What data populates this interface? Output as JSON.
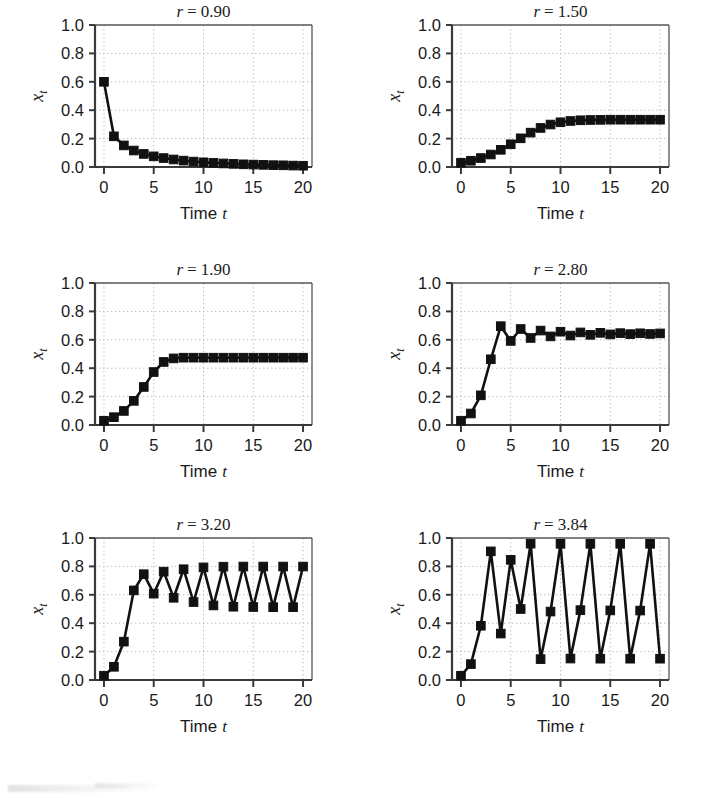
{
  "figure": {
    "panel_count": 6,
    "axis": {
      "xlabel_prefix": "Time",
      "xlabel_italic": "t",
      "ylabel": "x",
      "ylabel_sub": "t",
      "x_ticks": [
        "0",
        "5",
        "10",
        "15",
        "20"
      ],
      "x_tick_values": [
        0,
        5,
        10,
        15,
        20
      ],
      "y_ticks": [
        "0.0",
        "0.2",
        "0.4",
        "0.6",
        "0.8",
        "1.0"
      ],
      "y_tick_values": [
        0.0,
        0.2,
        0.4,
        0.6,
        0.8,
        1.0
      ],
      "xlim": [
        -0.9,
        20.9
      ],
      "ylim": [
        0.0,
        1.0
      ]
    },
    "style": {
      "line_color": "#111111",
      "marker_color": "#111111",
      "marker_shape": "square",
      "grid_color": "#bdbdbd",
      "grid_style": "dotted",
      "frame_color": "#555555",
      "background": "#ffffff"
    }
  },
  "chart_data": [
    {
      "type": "line",
      "title": "r = 0.90",
      "title_symbol": "r",
      "title_value": "0.90",
      "r": 0.9,
      "xlabel": "Time t",
      "ylabel": "x_t",
      "xlim": [
        -0.9,
        20.9
      ],
      "ylim": [
        0.0,
        1.0
      ],
      "grid": true,
      "legend": "none",
      "x": [
        0,
        1,
        2,
        3,
        4,
        5,
        6,
        7,
        8,
        9,
        10,
        11,
        12,
        13,
        14,
        15,
        16,
        17,
        18,
        19,
        20
      ],
      "values": [
        0.6,
        0.216,
        0.152,
        0.116,
        0.092,
        0.075,
        0.063,
        0.053,
        0.045,
        0.038,
        0.033,
        0.029,
        0.025,
        0.022,
        0.019,
        0.017,
        0.015,
        0.013,
        0.012,
        0.01,
        0.009
      ]
    },
    {
      "type": "line",
      "title": "r = 1.50",
      "title_symbol": "r",
      "title_value": "1.50",
      "r": 1.5,
      "xlabel": "Time t",
      "ylabel": "x_t",
      "xlim": [
        -0.9,
        20.9
      ],
      "ylim": [
        0.0,
        1.0
      ],
      "grid": true,
      "legend": "none",
      "x": [
        0,
        1,
        2,
        3,
        4,
        5,
        6,
        7,
        8,
        9,
        10,
        11,
        12,
        13,
        14,
        15,
        16,
        17,
        18,
        19,
        20
      ],
      "values": [
        0.03,
        0.044,
        0.063,
        0.088,
        0.121,
        0.16,
        0.202,
        0.242,
        0.275,
        0.299,
        0.315,
        0.324,
        0.329,
        0.331,
        0.332,
        0.333,
        0.333,
        0.333,
        0.333,
        0.333,
        0.333
      ]
    },
    {
      "type": "line",
      "title": "r = 1.90",
      "title_symbol": "r",
      "title_value": "1.90",
      "r": 1.9,
      "xlabel": "Time t",
      "ylabel": "x_t",
      "xlim": [
        -0.9,
        20.9
      ],
      "ylim": [
        0.0,
        1.0
      ],
      "grid": true,
      "legend": "none",
      "x": [
        0,
        1,
        2,
        3,
        4,
        5,
        6,
        7,
        8,
        9,
        10,
        11,
        12,
        13,
        14,
        15,
        16,
        17,
        18,
        19,
        20
      ],
      "values": [
        0.03,
        0.055,
        0.099,
        0.17,
        0.268,
        0.373,
        0.444,
        0.469,
        0.474,
        0.474,
        0.474,
        0.474,
        0.474,
        0.474,
        0.474,
        0.474,
        0.474,
        0.474,
        0.474,
        0.474,
        0.474
      ]
    },
    {
      "type": "line",
      "title": "r = 2.80",
      "title_symbol": "r",
      "title_value": "2.80",
      "r": 2.8,
      "xlabel": "Time t",
      "ylabel": "x_t",
      "xlim": [
        -0.9,
        20.9
      ],
      "ylim": [
        0.0,
        1.0
      ],
      "grid": true,
      "legend": "none",
      "x": [
        0,
        1,
        2,
        3,
        4,
        5,
        6,
        7,
        8,
        9,
        10,
        11,
        12,
        13,
        14,
        15,
        16,
        17,
        18,
        19,
        20
      ],
      "values": [
        0.03,
        0.081,
        0.209,
        0.463,
        0.696,
        0.592,
        0.676,
        0.613,
        0.665,
        0.624,
        0.657,
        0.63,
        0.652,
        0.635,
        0.649,
        0.638,
        0.647,
        0.64,
        0.646,
        0.641,
        0.645
      ]
    },
    {
      "type": "line",
      "title": "r = 3.20",
      "title_symbol": "r",
      "title_value": "3.20",
      "r": 3.2,
      "xlabel": "Time t",
      "ylabel": "x_t",
      "xlim": [
        -0.9,
        20.9
      ],
      "ylim": [
        0.0,
        1.0
      ],
      "grid": true,
      "legend": "none",
      "x": [
        0,
        1,
        2,
        3,
        4,
        5,
        6,
        7,
        8,
        9,
        10,
        11,
        12,
        13,
        14,
        15,
        16,
        17,
        18,
        19,
        20
      ],
      "values": [
        0.03,
        0.093,
        0.27,
        0.631,
        0.745,
        0.608,
        0.763,
        0.579,
        0.78,
        0.549,
        0.793,
        0.525,
        0.798,
        0.516,
        0.799,
        0.514,
        0.799,
        0.513,
        0.799,
        0.513,
        0.799
      ]
    },
    {
      "type": "line",
      "title": "r = 3.84",
      "title_symbol": "r",
      "title_value": "3.84",
      "r": 3.84,
      "xlabel": "Time t",
      "ylabel": "x_t",
      "xlim": [
        -0.9,
        20.9
      ],
      "ylim": [
        0.0,
        1.0
      ],
      "grid": true,
      "legend": "none",
      "x": [
        0,
        1,
        2,
        3,
        4,
        5,
        6,
        7,
        8,
        9,
        10,
        11,
        12,
        13,
        14,
        15,
        16,
        17,
        18,
        19,
        20
      ],
      "values": [
        0.03,
        0.112,
        0.382,
        0.906,
        0.327,
        0.846,
        0.5,
        0.96,
        0.147,
        0.482,
        0.959,
        0.151,
        0.492,
        0.959,
        0.15,
        0.49,
        0.959,
        0.15,
        0.489,
        0.959,
        0.15
      ]
    }
  ]
}
